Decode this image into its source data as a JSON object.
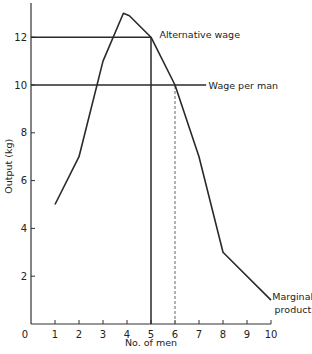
{
  "chart_data": {
    "type": "line",
    "title": "",
    "xlabel": "No. of men",
    "ylabel": "Output (kg)",
    "xlim": [
      0,
      10
    ],
    "ylim": [
      0,
      13.5
    ],
    "grid": false,
    "x_ticks": [
      1,
      2,
      3,
      4,
      5,
      6,
      7,
      8,
      9,
      10
    ],
    "x_tick_labels": [
      "1",
      "2",
      "3",
      "4",
      "5",
      "6",
      "7",
      "8",
      "9",
      "10"
    ],
    "y_ticks": [
      2,
      4,
      6,
      8,
      10,
      12
    ],
    "y_tick_labels": [
      "2",
      "4",
      "6",
      "8",
      "10",
      "12"
    ],
    "origin_label": "0",
    "series": [
      {
        "name": "Marginal product",
        "x": [
          1,
          2,
          3,
          3.85,
          4.1,
          5,
          6,
          7,
          8,
          10
        ],
        "y": [
          5,
          7,
          11,
          13,
          12.9,
          12,
          10,
          7,
          3,
          1
        ]
      }
    ],
    "reference_lines": [
      {
        "name": "Alternative wage",
        "orientation": "horizontal",
        "y": 12,
        "x_from": 0,
        "x_to": 5,
        "style": "solid"
      },
      {
        "name": "Wage per man",
        "orientation": "horizontal",
        "y": 10,
        "x_from": 0,
        "x_to": 7.3,
        "style": "solid"
      },
      {
        "name": "Employment at alternative wage",
        "orientation": "vertical",
        "x": 5,
        "y_from": 0,
        "y_to": 12,
        "style": "solid"
      },
      {
        "name": "Employment at wage per man",
        "orientation": "vertical",
        "x": 6,
        "y_from": 0,
        "y_to": 10,
        "style": "dashed"
      }
    ],
    "annotations": [
      {
        "text": "Alternative wage",
        "x": 5.35,
        "y": 12.1
      },
      {
        "text": "Wage per man",
        "x": 7.4,
        "y": 10
      },
      {
        "text": "Marginal",
        "x": 10.05,
        "y": 1.15
      },
      {
        "text": "product",
        "x": 10.15,
        "y": 0.6
      }
    ]
  }
}
